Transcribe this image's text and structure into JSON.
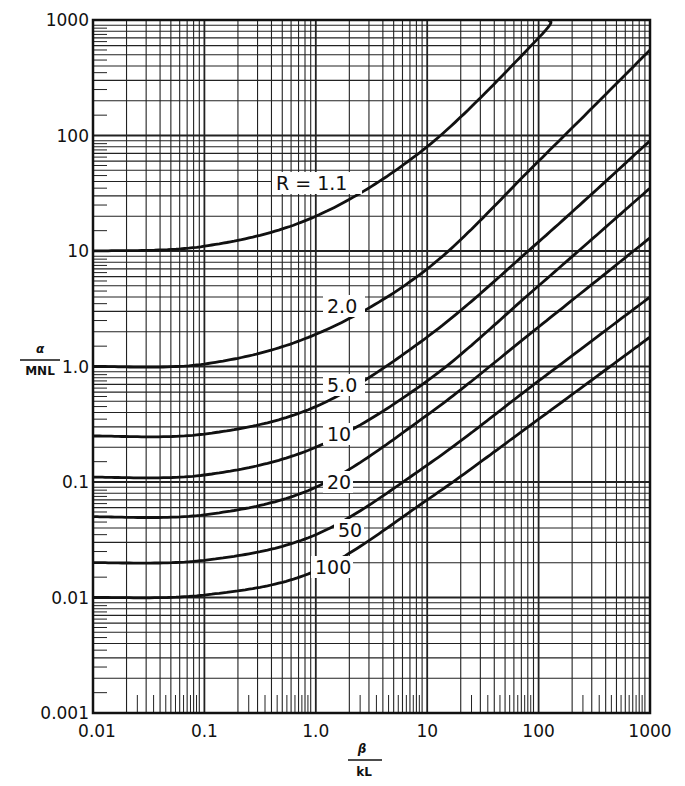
{
  "chart_data": {
    "type": "line",
    "title": "",
    "xlabel": "β / kL",
    "ylabel": "α / MNL",
    "xscale": "log",
    "yscale": "log",
    "xlim": [
      0.01,
      1000
    ],
    "ylim": [
      0.001,
      1000
    ],
    "grid": true,
    "legend": "inline curve labels",
    "x_ticks": [
      "0.01",
      "0.1",
      "1.0",
      "10",
      "100",
      "1000"
    ],
    "y_ticks": [
      "0.001",
      "0.01",
      "0.1",
      "1.0",
      "10",
      "100",
      "1000"
    ],
    "x": [
      0.01,
      0.1,
      1.0,
      10,
      100,
      1000
    ],
    "series": [
      {
        "name": "R = 1.1",
        "label": "R = 1.1",
        "values": [
          10,
          11,
          20,
          80,
          700,
          null
        ],
        "x_at_top": 125
      },
      {
        "name": "2.0",
        "label": "2.0",
        "values": [
          1.0,
          1.05,
          1.9,
          7,
          60,
          550
        ]
      },
      {
        "name": "5.0",
        "label": "5.0",
        "values": [
          0.25,
          0.26,
          0.45,
          1.8,
          12,
          90
        ]
      },
      {
        "name": "10",
        "label": "10",
        "values": [
          0.11,
          0.115,
          0.2,
          0.75,
          5,
          35
        ]
      },
      {
        "name": "20",
        "label": "20",
        "values": [
          0.05,
          0.052,
          0.09,
          0.38,
          2.2,
          13
        ]
      },
      {
        "name": "50",
        "label": "50",
        "values": [
          0.02,
          0.021,
          0.035,
          0.14,
          0.75,
          4
        ]
      },
      {
        "name": "100",
        "label": "100",
        "values": [
          0.01,
          0.0105,
          0.017,
          0.07,
          0.35,
          1.8
        ]
      }
    ]
  },
  "labels": {
    "y_numer": "α",
    "y_denom": "MNL",
    "x_numer": "β",
    "x_denom": "kL"
  }
}
